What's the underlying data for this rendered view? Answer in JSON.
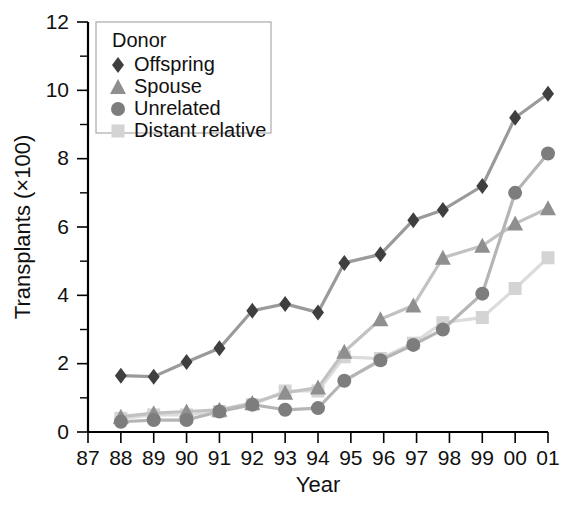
{
  "chart_data": {
    "type": "line",
    "title": "",
    "xlabel": "Year",
    "ylabel": "Transplants (×100)",
    "legend_title": "Donor",
    "legend_position": "top-left-inside",
    "grid": false,
    "xlim": [
      87,
      101
    ],
    "ylim": [
      0,
      12
    ],
    "y_ticks": [
      0,
      2,
      4,
      6,
      8,
      10,
      12
    ],
    "y_minor_ticks": [
      1,
      3,
      5,
      7,
      9,
      11
    ],
    "x_tick_labels": [
      "87",
      "88",
      "89",
      "90",
      "91",
      "92",
      "93",
      "94",
      "95",
      "96",
      "97",
      "98",
      "99",
      "00",
      "01"
    ],
    "x_tick_values": [
      87,
      88,
      89,
      90,
      91,
      92,
      93,
      94,
      95,
      96,
      97,
      98,
      99,
      100,
      101
    ],
    "series": [
      {
        "name": "Offspring",
        "marker": "diamond",
        "color": "#3f3f3f",
        "line_color": "#9a9a9a",
        "x": [
          88,
          89,
          90,
          91,
          92,
          93,
          94,
          94.8,
          95.9,
          96.9,
          97.8,
          99,
          100,
          101
        ],
        "values": [
          1.65,
          1.62,
          2.05,
          2.45,
          3.55,
          3.75,
          3.5,
          4.95,
          5.2,
          6.2,
          6.5,
          7.2,
          9.2,
          9.9
        ]
      },
      {
        "name": "Spouse",
        "marker": "triangle",
        "color": "#8f8f8f",
        "line_color": "#c2c2c2",
        "x": [
          88,
          89,
          90,
          91,
          92,
          93,
          94,
          94.8,
          95.9,
          96.9,
          97.8,
          99,
          100,
          101
        ],
        "values": [
          0.45,
          0.55,
          0.6,
          0.65,
          0.85,
          1.15,
          1.3,
          2.35,
          3.3,
          3.7,
          5.1,
          5.45,
          6.1,
          6.55
        ]
      },
      {
        "name": "Unrelated",
        "marker": "circle",
        "color": "#7d7d7d",
        "line_color": "#b5b5b5",
        "x": [
          88,
          89,
          90,
          91,
          92,
          93,
          94,
          94.8,
          95.9,
          96.9,
          97.8,
          99,
          100,
          101
        ],
        "values": [
          0.3,
          0.35,
          0.35,
          0.6,
          0.8,
          0.65,
          0.7,
          1.5,
          2.1,
          2.55,
          3.0,
          4.05,
          7.0,
          8.15
        ]
      },
      {
        "name": "Distant relative",
        "marker": "square",
        "color": "#d4d4d4",
        "line_color": "#dcdcdc",
        "x": [
          88,
          89,
          90,
          91,
          92,
          93,
          94,
          94.8,
          95.9,
          96.9,
          97.8,
          99,
          100,
          101
        ],
        "values": [
          0.4,
          0.5,
          0.5,
          0.6,
          0.8,
          1.2,
          1.2,
          2.2,
          2.15,
          2.6,
          3.2,
          3.35,
          4.2,
          5.1
        ]
      }
    ]
  }
}
